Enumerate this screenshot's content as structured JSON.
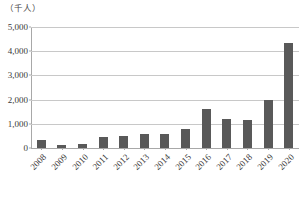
{
  "unit_label": "（千人）",
  "colors": {
    "bar": "#595959",
    "gridline": "#c8c8c8",
    "axis": "#a8a8a8",
    "text": "#3a3a3a",
    "background": "#ffffff"
  },
  "chart_data": {
    "type": "bar",
    "title": "",
    "subtitle": "",
    "xlabel": "",
    "ylabel": "（千人）",
    "ylim": [
      0,
      5000
    ],
    "ytick_step": 1000,
    "ytick_labels": [
      "5,000",
      "4,000",
      "3,000",
      "2,000",
      "1,000",
      "0"
    ],
    "ytick_values": [
      5000,
      4000,
      3000,
      2000,
      1000,
      0
    ],
    "grid": true,
    "legend": false,
    "legend_position": "none",
    "categories": [
      "2008",
      "2009",
      "2010",
      "2011",
      "2012",
      "2013",
      "2014",
      "2015",
      "2016",
      "2017",
      "2018",
      "2019",
      "2020"
    ],
    "values": [
      330,
      130,
      160,
      450,
      500,
      570,
      570,
      790,
      1620,
      1200,
      1150,
      2000,
      4350
    ],
    "series": [
      {
        "name": "",
        "values": [
          330,
          130,
          160,
          450,
          500,
          570,
          570,
          790,
          1620,
          1200,
          1150,
          2000,
          4350
        ]
      }
    ],
    "xtick_rotation": -45,
    "annotations": []
  }
}
